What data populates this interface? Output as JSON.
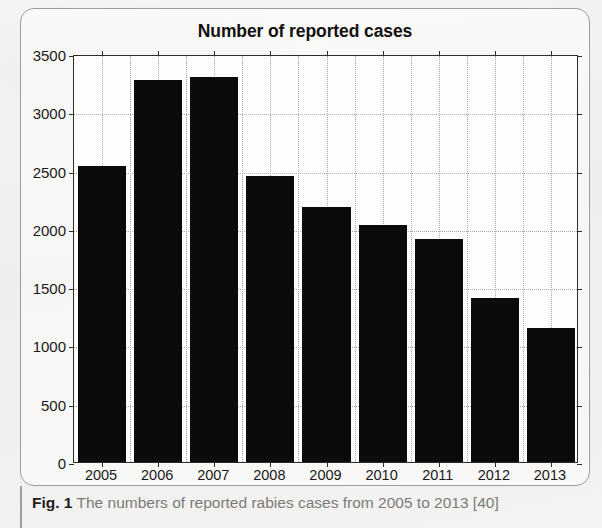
{
  "figure": {
    "caption_label": "Fig. 1",
    "caption_text": "The numbers of reported rabies cases from 2005 to 2013 [40]"
  },
  "chart_data": {
    "type": "bar",
    "title": "Number of reported cases",
    "xlabel": "",
    "ylabel": "",
    "categories": [
      "2005",
      "2006",
      "2007",
      "2008",
      "2009",
      "2010",
      "2011",
      "2012",
      "2013"
    ],
    "values": [
      2540,
      3280,
      3300,
      2450,
      2190,
      2030,
      1910,
      1410,
      1150
    ],
    "ylim": [
      0,
      3500
    ],
    "ytick_labels": [
      "0",
      "500",
      "1000",
      "1500",
      "2000",
      "2500",
      "3000",
      "3500"
    ],
    "ytick_values": [
      0,
      500,
      1000,
      1500,
      2000,
      2500,
      3000,
      3500
    ],
    "grid": true,
    "legend": "none",
    "bar_color": "#0b0b0b",
    "plot_background": "#fdfdfc",
    "axis_color": "#2b2b2b",
    "grid_color": "#a9a9a9"
  }
}
